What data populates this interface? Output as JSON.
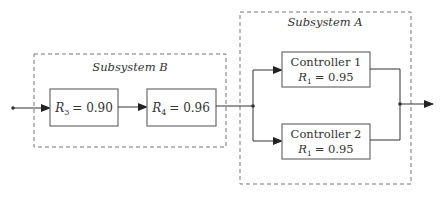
{
  "diagram": {
    "type": "reliability-block-diagram",
    "subsystems": [
      {
        "id": "B",
        "label": "Subsystem B",
        "arrangement": "series",
        "blocks": [
          {
            "name": "R3",
            "symbol": "R",
            "subscript": "3",
            "value": "0.90",
            "text": "= 0.90"
          },
          {
            "name": "R4",
            "symbol": "R",
            "subscript": "4",
            "value": "0.96",
            "text": "= 0.96"
          }
        ]
      },
      {
        "id": "A",
        "label": "Subsystem A",
        "arrangement": "parallel",
        "blocks": [
          {
            "title": "Controller 1",
            "symbol": "R",
            "subscript": "1",
            "value": "0.95",
            "text": "= 0.95"
          },
          {
            "title": "Controller 2",
            "symbol": "R",
            "subscript": "1",
            "value": "0.95",
            "text": "= 0.95"
          }
        ]
      }
    ],
    "colors": {
      "line": "#333333",
      "box_border": "#777777",
      "dashed": "#777777"
    }
  }
}
